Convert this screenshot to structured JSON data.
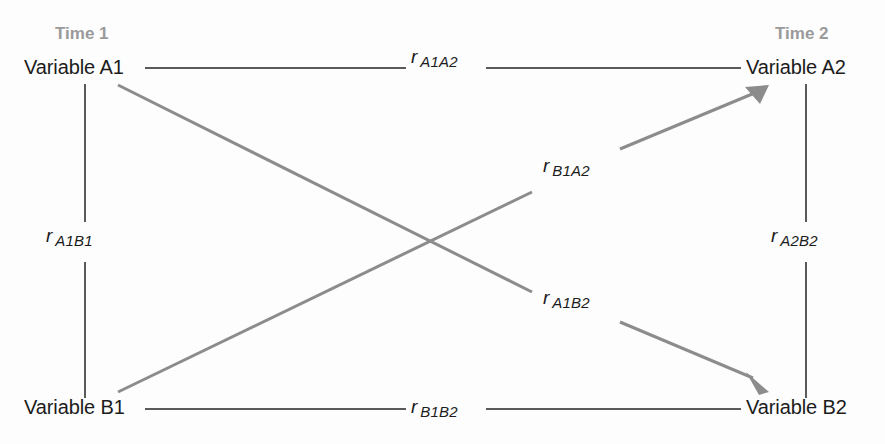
{
  "diagram": {
    "type": "cross-lagged-panel-correlation-diagram",
    "colors": {
      "background": "#fdfdfd",
      "node_text": "#1c1c1c",
      "time_header": "#9a9a9a",
      "straight_line": "#5a5a5a",
      "diagonal_arrow": "#8c8c8c"
    },
    "headers": {
      "time1": "Time 1",
      "time2": "Time 2"
    },
    "nodes": {
      "a1": "Variable A1",
      "a2": "Variable A2",
      "b1": "Variable B1",
      "b2": "Variable B2"
    },
    "edges": {
      "a1a2": {
        "symbol": "r",
        "subscript": "A1A2",
        "kind": "horizontal-line",
        "from": "a1",
        "to": "a2"
      },
      "b1b2": {
        "symbol": "r",
        "subscript": "B1B2",
        "kind": "horizontal-line",
        "from": "b1",
        "to": "b2"
      },
      "a1b1": {
        "symbol": "r",
        "subscript": "A1B1",
        "kind": "vertical-line",
        "from": "a1",
        "to": "b1"
      },
      "a2b2": {
        "symbol": "r",
        "subscript": "A2B2",
        "kind": "vertical-line",
        "from": "a2",
        "to": "b2"
      },
      "b1a2": {
        "symbol": "r",
        "subscript": "B1A2",
        "kind": "diagonal-arrow",
        "from": "b1",
        "to": "a2"
      },
      "a1b2": {
        "symbol": "r",
        "subscript": "A1B2",
        "kind": "diagonal-arrow",
        "from": "a1",
        "to": "b2"
      }
    }
  }
}
